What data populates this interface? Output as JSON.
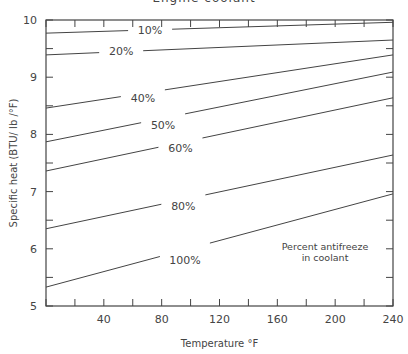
{
  "chart_data": {
    "type": "line",
    "title": "Engine coolant",
    "xlabel": "Temperature °F",
    "ylabel": "Specific heat (BTU/ lb /°F)",
    "xlim": [
      0,
      240
    ],
    "ylim": [
      5,
      10
    ],
    "xticks": [
      0,
      20,
      40,
      60,
      80,
      100,
      120,
      140,
      160,
      180,
      200,
      220,
      240
    ],
    "xtick_labels": [
      "",
      "",
      "40",
      "",
      "80",
      "",
      "120",
      "",
      "160",
      "",
      "200",
      "",
      "240"
    ],
    "yticks": [
      5,
      5.5,
      6,
      6.5,
      7,
      7.5,
      8,
      8.5,
      9,
      9.5,
      10
    ],
    "ytick_labels": [
      "5",
      "",
      "6",
      "",
      "7",
      "",
      "8",
      "",
      "9",
      "",
      "10"
    ],
    "grid": false,
    "legend": "inline labels on curves",
    "annotation": [
      "Percent antifreeze",
      "in coolant"
    ],
    "series": [
      {
        "name": "10%",
        "label": "10%",
        "x": [
          0,
          240
        ],
        "values": [
          9.77,
          9.96
        ],
        "label_pos": [
          72,
          9.83
        ]
      },
      {
        "name": "20%",
        "label": "20%",
        "x": [
          0,
          240
        ],
        "values": [
          9.39,
          9.65
        ],
        "label_pos": [
          52,
          9.45
        ]
      },
      {
        "name": "40%",
        "label": "40%",
        "x": [
          0,
          240
        ],
        "values": [
          8.46,
          9.39
        ],
        "label_pos": [
          67,
          8.63
        ]
      },
      {
        "name": "50%",
        "label": "50%",
        "x": [
          0,
          240
        ],
        "values": [
          7.87,
          9.09
        ],
        "label_pos": [
          81,
          8.16
        ]
      },
      {
        "name": "60%",
        "label": "60%",
        "x": [
          0,
          240
        ],
        "values": [
          7.36,
          8.64
        ],
        "label_pos": [
          93,
          7.76
        ]
      },
      {
        "name": "80%",
        "label": "80%",
        "x": [
          0,
          240
        ],
        "values": [
          6.35,
          7.64
        ],
        "label_pos": [
          95,
          6.74
        ]
      },
      {
        "name": "100%",
        "label": "100%",
        "x": [
          0,
          240
        ],
        "values": [
          5.33,
          6.96
        ],
        "label_pos": [
          94,
          5.8
        ]
      }
    ]
  }
}
